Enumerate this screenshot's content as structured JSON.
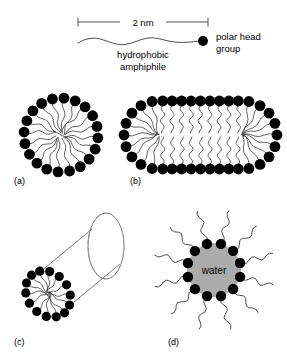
{
  "figure": {
    "background_color": "#ffffff",
    "width": 287,
    "height": 362
  },
  "scale": {
    "label": "2 nm",
    "bar_start_x": 78,
    "bar_end_x": 208,
    "bar_y": 22,
    "tick_height": 9,
    "color": "#555555"
  },
  "legend": {
    "amphiphile_label_line1": "hydrophobic",
    "amphiphile_label_line2": "amphiphile",
    "head_label_line1": "polar head",
    "head_label_line2": "group",
    "head_color": "#000000",
    "tail_color": "#3a3a3a",
    "head_x": 203,
    "head_y": 41,
    "head_r": 5
  },
  "panels": [
    {
      "id": "a",
      "label": "(a)",
      "label_x": 14,
      "label_y": 184,
      "type": "spherical-micelle",
      "description": "spherical micelle, polar heads outward, hydrophobic tails inward",
      "center_x": 61,
      "center_y": 135,
      "head_ring_radius": 37,
      "head_count": 20,
      "head_radius": 5.4
    },
    {
      "id": "b",
      "label": "(b)",
      "label_x": 130,
      "label_y": 184,
      "type": "rod-micelle",
      "description": "cylindrical rod micelle with hemispherical end caps, heads outward",
      "center_y": 135,
      "left_cap_x": 158,
      "right_cap_x": 243,
      "cap_radius": 34,
      "rod_head_count_top": 9,
      "rod_head_count_bottom": 9,
      "cap_head_count": 9,
      "head_radius": 5.4
    },
    {
      "id": "c",
      "label": "(c)",
      "label_x": 14,
      "label_y": 345,
      "type": "cylindrical-aggregate-3d",
      "description": "3D cylinder perspective with micelle cross-section at near end",
      "near_center_x": 48,
      "near_center_y": 294,
      "near_radius": 25,
      "far_center_x": 106,
      "far_center_y": 246,
      "far_rx": 18,
      "far_ry": 33,
      "head_count": 14,
      "head_radius": 4.6
    },
    {
      "id": "d",
      "label": "(d)",
      "label_x": 168,
      "label_y": 345,
      "type": "reverse-micelle",
      "description": "inverted micelle, polar heads inward around water core, tails outward",
      "center_x": 214,
      "center_y": 270,
      "core_radius": 27,
      "core_color": "#ababab",
      "core_label": "water",
      "head_count": 12,
      "head_ring_radius": 27,
      "head_radius": 5.2,
      "tail_length": 34
    }
  ]
}
